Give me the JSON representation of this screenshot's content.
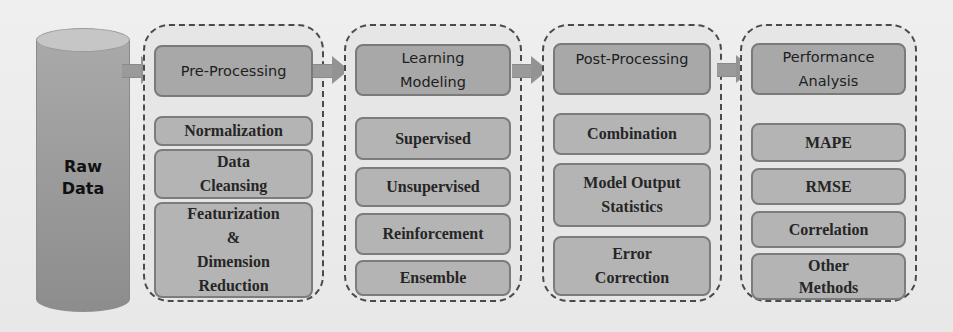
{
  "diagram": {
    "source": {
      "label_line1": "Raw",
      "label_line2": "Data"
    },
    "stages": [
      {
        "title": "Pre-Processing",
        "items": [
          "Normalization",
          "Data\nCleansing",
          "Featurization\n&\nDimension\nReduction"
        ]
      },
      {
        "title": "Learning\nModeling",
        "items": [
          "Supervised",
          "Unsupervised",
          "Reinforcement",
          "Ensemble"
        ]
      },
      {
        "title": "Post-Processing",
        "items": [
          "Combination",
          "Model Output\nStatistics",
          "Error\nCorrection"
        ]
      },
      {
        "title": "Performance\nAnalysis",
        "items": [
          "MAPE",
          "RMSE",
          "Correlation",
          "Other\nMethods"
        ]
      }
    ],
    "colors": {
      "background": "#ececec",
      "stage_fill": "#e6e6e6",
      "stage_border": "#4a4a4a",
      "header_fill": "#a8a8a8",
      "item_fill": "#b4b4b4",
      "arrow": "#999999",
      "cylinder": "#9c9c9c"
    }
  }
}
